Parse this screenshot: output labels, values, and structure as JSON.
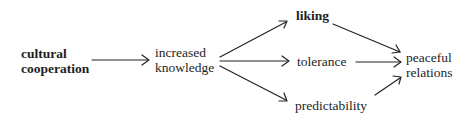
{
  "diagram": {
    "nodes": {
      "cultural_cooperation": {
        "line1": "cultural",
        "line2": "cooperation",
        "bold": true
      },
      "increased_knowledge": {
        "line1": "increased",
        "line2": "knowledge",
        "bold": false
      },
      "liking": {
        "label": "liking",
        "bold": true
      },
      "tolerance": {
        "label": "tolerance",
        "bold": false
      },
      "predictability": {
        "label": "predictability",
        "bold": false
      },
      "peaceful_relations": {
        "line1": "peaceful",
        "line2": "relations",
        "bold": false
      }
    },
    "edges": [
      {
        "from": "cultural cooperation",
        "to": "increased knowledge"
      },
      {
        "from": "increased knowledge",
        "to": "liking"
      },
      {
        "from": "increased knowledge",
        "to": "tolerance"
      },
      {
        "from": "increased knowledge",
        "to": "predictability"
      },
      {
        "from": "liking",
        "to": "peaceful relations"
      },
      {
        "from": "tolerance",
        "to": "peaceful relations"
      },
      {
        "from": "predictability",
        "to": "peaceful relations"
      }
    ],
    "colors": {
      "ink": "#1e1e1e",
      "background": "#ffffff"
    }
  }
}
